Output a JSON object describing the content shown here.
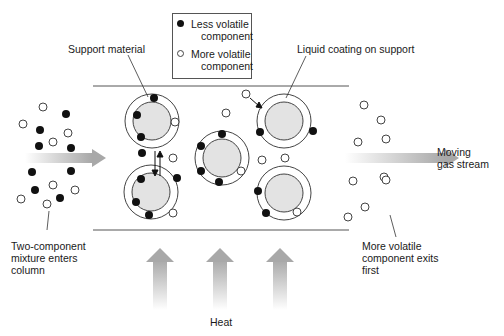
{
  "diagram": {
    "colors": {
      "less_volatile": "#111111",
      "more_volatile": "#ffffff",
      "support_fill": "#e3e3e3",
      "outline": "#444444",
      "arrow_gray": "#b0b0b0"
    },
    "legend": {
      "less_volatile": "Less volatile component",
      "less_volatile_line1": "Less volatile",
      "less_volatile_line2": "component",
      "more_volatile": "More volatile component",
      "more_volatile_line1": "More volatile",
      "more_volatile_line2": "component"
    },
    "labels": {
      "support_material": "Support material",
      "liquid_coating": "Liquid coating on support",
      "moving_gas_line1": "Moving",
      "moving_gas_line2": "gas stream",
      "mixture_line1": "Two-component",
      "mixture_line2": "mixture enters",
      "mixture_line3": "column",
      "exits_line1": "More volatile",
      "exits_line2": "component exits",
      "exits_line3": "first",
      "heat": "Heat"
    },
    "particles": [
      {
        "name": "top-left-particle",
        "cx": 152,
        "cy": 121
      },
      {
        "name": "bottom-left-particle",
        "cx": 151,
        "cy": 192
      },
      {
        "name": "center-particle",
        "cx": 222,
        "cy": 158
      },
      {
        "name": "top-right-particle",
        "cx": 284,
        "cy": 121
      },
      {
        "name": "bottom-right-particle",
        "cx": 284,
        "cy": 193
      }
    ]
  }
}
